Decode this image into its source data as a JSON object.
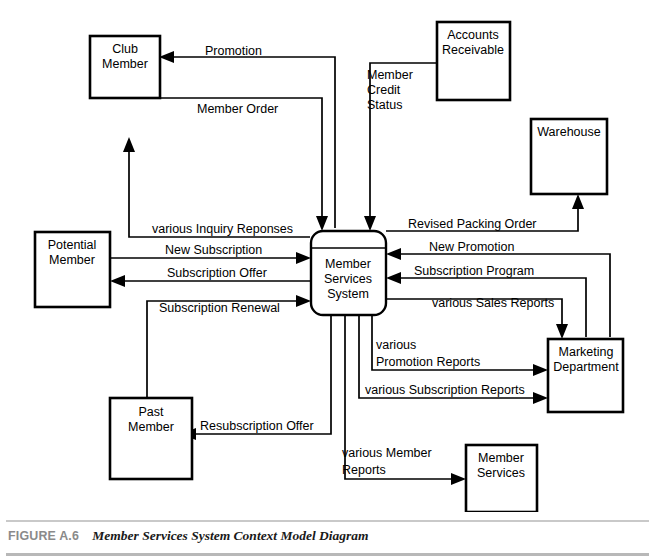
{
  "figure": {
    "number": "FIGURE A.6",
    "title": "Member Services System Context Model Diagram"
  },
  "diagram": {
    "type": "data-flow-context-diagram",
    "process": {
      "id": "member-services-system",
      "label_lines": [
        "Member",
        "Services",
        "System"
      ],
      "shape": "rounded-rectangle"
    },
    "entities": [
      {
        "id": "club-member",
        "label_lines": [
          "Club",
          "Member"
        ]
      },
      {
        "id": "accounts-receivable",
        "label_lines": [
          "Accounts",
          "Receivable"
        ]
      },
      {
        "id": "warehouse",
        "label_lines": [
          "Warehouse"
        ]
      },
      {
        "id": "potential-member",
        "label_lines": [
          "Potential",
          "Member"
        ]
      },
      {
        "id": "marketing-department",
        "label_lines": [
          "Marketing",
          "Department"
        ]
      },
      {
        "id": "past-member",
        "label_lines": [
          "Past",
          "Member"
        ]
      },
      {
        "id": "member-services",
        "label_lines": [
          "Member",
          "Services"
        ]
      }
    ],
    "flows": [
      {
        "id": "promotion",
        "label": "Promotion",
        "from": "member-services-system",
        "to": "club-member"
      },
      {
        "id": "member-order",
        "label": "Member Order",
        "from": "club-member",
        "to": "member-services-system"
      },
      {
        "id": "member-credit-status",
        "label_lines": [
          "Member",
          "Credit",
          "Status"
        ],
        "from": "accounts-receivable",
        "to": "member-services-system"
      },
      {
        "id": "various-inquiry-reponses",
        "label": "various Inquiry Reponses",
        "from": "member-services-system",
        "to": "club-member"
      },
      {
        "id": "revised-packing-order",
        "label": "Revised Packing Order",
        "from": "member-services-system",
        "to": "warehouse"
      },
      {
        "id": "new-subscription",
        "label": "New Subscription",
        "from": "potential-member",
        "to": "member-services-system"
      },
      {
        "id": "subscription-offer",
        "label": "Subscription Offer",
        "from": "member-services-system",
        "to": "potential-member"
      },
      {
        "id": "new-promotion",
        "label": "New Promotion",
        "from": "marketing-department",
        "to": "member-services-system"
      },
      {
        "id": "subscription-program",
        "label": "Subscription Program",
        "from": "marketing-department",
        "to": "member-services-system"
      },
      {
        "id": "subscription-renewal",
        "label": "Subscription Renewal",
        "from": "past-member",
        "to": "member-services-system"
      },
      {
        "id": "various-sales-reports",
        "label": "various Sales Reports",
        "from": "member-services-system",
        "to": "marketing-department"
      },
      {
        "id": "various-promotion-reports",
        "label_lines": [
          "various",
          "Promotion Reports"
        ],
        "from": "member-services-system",
        "to": "marketing-department"
      },
      {
        "id": "various-subscription-reports",
        "label": "various Subscription Reports",
        "from": "member-services-system",
        "to": "marketing-department"
      },
      {
        "id": "resubscription-offer",
        "label": "Resubscription Offer",
        "from": "member-services-system",
        "to": "past-member"
      },
      {
        "id": "various-member-reports",
        "label_lines": [
          "various Member",
          "Reports"
        ],
        "from": "member-services-system",
        "to": "member-services"
      }
    ]
  }
}
